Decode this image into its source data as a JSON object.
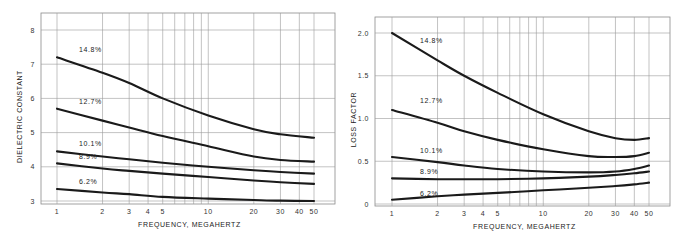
{
  "chart_data": [
    {
      "type": "line",
      "title": "",
      "xlabel": "FREQUENCY, MEGAHERTZ",
      "ylabel": "DIELECTRIC CONSTANT",
      "xscale": "log",
      "xlim": [
        1,
        50
      ],
      "ylim": [
        3,
        8
      ],
      "grid": true,
      "x_ticks": [
        "1",
        "2",
        "3",
        "4",
        "5",
        "10",
        "20",
        "30",
        "40",
        "50"
      ],
      "y_ticks": [
        "3",
        "4",
        "5",
        "6",
        "7",
        "8"
      ],
      "x": [
        1,
        2,
        3,
        5,
        10,
        20,
        30,
        50
      ],
      "series": [
        {
          "name": "14.8%",
          "values": [
            7.2,
            6.75,
            6.45,
            6.0,
            5.5,
            5.1,
            4.95,
            4.85
          ]
        },
        {
          "name": "12.7%",
          "values": [
            5.7,
            5.35,
            5.15,
            4.9,
            4.6,
            4.3,
            4.2,
            4.15
          ]
        },
        {
          "name": "10.1%",
          "values": [
            4.45,
            4.3,
            4.22,
            4.12,
            4.0,
            3.9,
            3.85,
            3.8
          ]
        },
        {
          "name": "8.9%",
          "values": [
            4.1,
            3.95,
            3.88,
            3.8,
            3.7,
            3.6,
            3.55,
            3.5
          ]
        },
        {
          "name": "6.2%",
          "values": [
            3.35,
            3.25,
            3.2,
            3.12,
            3.07,
            3.03,
            3.01,
            3.0
          ]
        }
      ]
    },
    {
      "type": "line",
      "title": "",
      "xlabel": "FREQUENCY, MEGAHERTZ",
      "ylabel": "LOSS FACTOR",
      "xscale": "log",
      "xlim": [
        1,
        50
      ],
      "ylim": [
        0,
        2.0
      ],
      "grid": true,
      "x_ticks": [
        "1",
        "2",
        "3",
        "4",
        "5",
        "10",
        "20",
        "30",
        "40",
        "50"
      ],
      "y_ticks": [
        "0",
        "0.5",
        "1.0",
        "1.5",
        "2.0"
      ],
      "x": [
        1,
        2,
        3,
        5,
        10,
        20,
        30,
        40,
        50
      ],
      "series": [
        {
          "name": "14.8%",
          "values": [
            2.0,
            1.68,
            1.5,
            1.3,
            1.05,
            0.85,
            0.77,
            0.75,
            0.77
          ]
        },
        {
          "name": "12.7%",
          "values": [
            1.1,
            0.95,
            0.85,
            0.75,
            0.64,
            0.56,
            0.55,
            0.56,
            0.6
          ]
        },
        {
          "name": "10.1%",
          "values": [
            0.55,
            0.49,
            0.45,
            0.41,
            0.38,
            0.37,
            0.38,
            0.41,
            0.45
          ]
        },
        {
          "name": "8.9%",
          "values": [
            0.3,
            0.29,
            0.29,
            0.29,
            0.3,
            0.32,
            0.34,
            0.36,
            0.38
          ]
        },
        {
          "name": "6.2%",
          "values": [
            0.05,
            0.09,
            0.11,
            0.13,
            0.16,
            0.19,
            0.21,
            0.23,
            0.25
          ]
        }
      ]
    }
  ]
}
